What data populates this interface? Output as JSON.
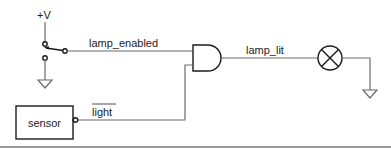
{
  "diagram": {
    "supply_label": "+V",
    "signals": {
      "switch_output": "lamp_enabled",
      "gate_output": "lamp_lit",
      "sensor_output": "light",
      "sensor_output_inverted": true
    },
    "components": {
      "switch": "switch",
      "gate": "AND gate",
      "lamp": "lamp",
      "sensor": "sensor"
    },
    "colors": {
      "wire": "#6b6b6b",
      "symbol": "#1a1a1a",
      "background": "#ffffff"
    }
  }
}
